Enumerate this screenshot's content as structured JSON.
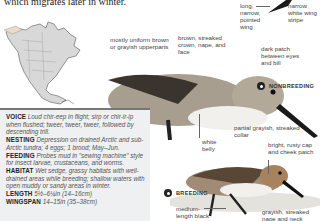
{
  "intro_text": "which migrates later in winter.",
  "map": {
    "alt": "North America range map"
  },
  "wing_labels": {
    "left": "long, narrow, pointed wing",
    "right": "narrow white wing stripe"
  },
  "nonbreeding": {
    "badge": "NONBREEDING",
    "labels": {
      "upperparts": "mostly uniform brown or grayish upperparts",
      "crown": "brown, streaked crown, nape, and face",
      "eye_patch": "dark patch between eyes and bill",
      "collar": "partial grayish, streaked collar",
      "belly": "white belly"
    }
  },
  "breeding": {
    "badge": "BREEDING",
    "labels": {
      "cap": "bright, rusty cap and cheek patch",
      "bill": "medium-length black bill",
      "nape": "grayish, streaked nape and neck"
    }
  },
  "info": {
    "voice": {
      "label": "VOICE",
      "text": "Loud chir-eep in flight; sirp or chir-ir-ip when flushed; ",
      "plain": "tweer, tweer, tweer,",
      "text2": " followed by descending trill."
    },
    "nesting": {
      "label": "NESTING",
      "text": "Depression on drained Arctic and sub-Arctic tundra; 4 eggs; 1 brood; May–Jun."
    },
    "feeding": {
      "label": "FEEDING",
      "text": "Probes mud in \"sewing machine\" style for insect larvae, crustaceans, and worms."
    },
    "habitat": {
      "label": "HABITAT",
      "text": "Wet sedge, grassy habitats with well-drained areas while breeding; shallow waters with open muddy or sandy areas in winter."
    },
    "length": {
      "label": "LENGTH",
      "text": "5½–6¼in (14–16cm)"
    },
    "wingspan": {
      "label": "WINGSPAN",
      "text": "14–15in (35–38cm)"
    }
  }
}
